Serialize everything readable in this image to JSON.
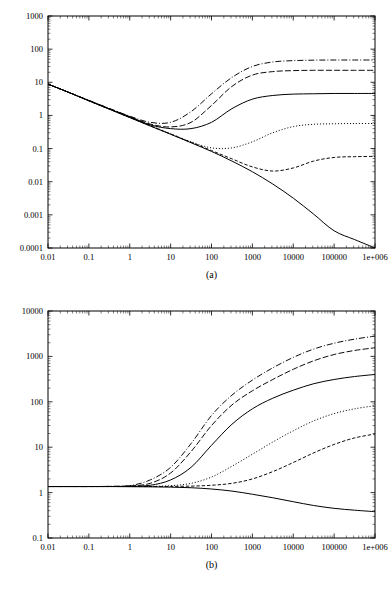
{
  "figure": {
    "panels": [
      {
        "id": "a",
        "caption": "(a)",
        "x_ticks": [
          "0.01",
          "0.1",
          "1",
          "10",
          "100",
          "1000",
          "10000",
          "100000",
          "1e+006"
        ],
        "y_ticks": [
          "0.0001",
          "0.001",
          "0.01",
          "0.1",
          "1",
          "10",
          "100",
          "1000"
        ]
      },
      {
        "id": "b",
        "caption": "(b)",
        "x_ticks": [
          "0.01",
          "0.1",
          "1",
          "10",
          "100",
          "1000",
          "10000",
          "100000",
          "1e+006"
        ],
        "y_ticks": [
          "0.1",
          "1",
          "10",
          "100",
          "1000",
          "10000"
        ]
      }
    ]
  },
  "chart_data": [
    {
      "type": "line",
      "title": "(a)",
      "xlabel": "",
      "ylabel": "",
      "xscale": "log",
      "yscale": "log",
      "xlim": [
        0.01,
        1000000
      ],
      "ylim": [
        0.0001,
        1000
      ],
      "grid": false,
      "legend": "none",
      "x_tick_labels": [
        "0.01",
        "0.1",
        "1",
        "10",
        "100",
        "1000",
        "10000",
        "100000",
        "1e+006"
      ],
      "y_tick_labels": [
        "0.0001",
        "0.001",
        "0.01",
        "0.1",
        "1",
        "10",
        "100",
        "1000"
      ],
      "x": [
        0.01,
        0.0316,
        0.1,
        0.316,
        1,
        3.16,
        10,
        31.6,
        100,
        316,
        1000,
        3160,
        10000,
        31600,
        100000,
        316000,
        1000000
      ],
      "series": [
        {
          "name": "curve-1-dashdot",
          "style": "dashdot",
          "values": [
            8.8,
            5.0,
            2.85,
            1.63,
            0.95,
            0.62,
            0.62,
            1.3,
            4.5,
            14,
            30,
            41,
            45,
            46.5,
            47,
            47,
            47
          ]
        },
        {
          "name": "curve-2-dashed",
          "style": "dashed",
          "values": [
            8.8,
            5.0,
            2.82,
            1.6,
            0.92,
            0.55,
            0.45,
            0.62,
            2.0,
            7.5,
            16.5,
            21,
            22.5,
            23,
            23,
            23,
            23
          ]
        },
        {
          "name": "curve-3-solid",
          "style": "solid",
          "values": [
            8.8,
            5.0,
            2.8,
            1.58,
            0.9,
            0.52,
            0.4,
            0.4,
            0.62,
            1.6,
            3.1,
            4.0,
            4.4,
            4.5,
            4.6,
            4.6,
            4.6
          ]
        },
        {
          "name": "curve-4-dotted",
          "style": "dotted",
          "values": [
            8.8,
            5.0,
            2.78,
            1.56,
            0.88,
            0.5,
            0.28,
            0.16,
            0.105,
            0.105,
            0.16,
            0.3,
            0.46,
            0.54,
            0.56,
            0.57,
            0.57
          ]
        },
        {
          "name": "curve-5-dashed-lower",
          "style": "dashed-short",
          "values": [
            8.8,
            5.0,
            2.76,
            1.55,
            0.87,
            0.49,
            0.275,
            0.155,
            0.087,
            0.049,
            0.028,
            0.021,
            0.026,
            0.042,
            0.054,
            0.057,
            0.058
          ]
        },
        {
          "name": "curve-6-solid-baseline",
          "style": "solid",
          "values": [
            8.8,
            5.0,
            2.75,
            1.54,
            0.86,
            0.48,
            0.27,
            0.15,
            0.082,
            0.042,
            0.02,
            0.0085,
            0.0032,
            0.00105,
            0.00033,
            0.00018,
            0.0001
          ]
        }
      ]
    },
    {
      "type": "line",
      "title": "(b)",
      "xlabel": "",
      "ylabel": "",
      "xscale": "log",
      "yscale": "log",
      "xlim": [
        0.01,
        1000000
      ],
      "ylim": [
        0.1,
        10000
      ],
      "grid": false,
      "legend": "none",
      "x_tick_labels": [
        "0.01",
        "0.1",
        "1",
        "10",
        "100",
        "1000",
        "10000",
        "100000",
        "1e+006"
      ],
      "y_tick_labels": [
        "0.1",
        "1",
        "10",
        "100",
        "1000",
        "10000"
      ],
      "x": [
        0.01,
        0.0316,
        0.1,
        0.316,
        1,
        3.16,
        10,
        31.6,
        100,
        316,
        1000,
        3160,
        10000,
        31600,
        100000,
        316000,
        1000000
      ],
      "series": [
        {
          "name": "curve-1-dashdot",
          "style": "dashdot",
          "values": [
            1.36,
            1.36,
            1.36,
            1.37,
            1.42,
            1.9,
            3.6,
            12,
            50,
            140,
            300,
            560,
            950,
            1450,
            1950,
            2400,
            2800
          ]
        },
        {
          "name": "curve-2-dashed",
          "style": "dashed",
          "values": [
            1.36,
            1.36,
            1.36,
            1.37,
            1.4,
            1.6,
            2.7,
            8.0,
            30,
            85,
            175,
            310,
            520,
            800,
            1100,
            1350,
            1550
          ]
        },
        {
          "name": "curve-3-solid",
          "style": "solid",
          "values": [
            1.36,
            1.36,
            1.36,
            1.36,
            1.38,
            1.45,
            1.9,
            3.6,
            11,
            32,
            70,
            120,
            180,
            250,
            310,
            360,
            400
          ]
        },
        {
          "name": "curve-4-dotted",
          "style": "dotted",
          "values": [
            1.36,
            1.36,
            1.36,
            1.36,
            1.36,
            1.37,
            1.42,
            1.6,
            2.2,
            3.8,
            7.0,
            13,
            23,
            38,
            55,
            70,
            82
          ]
        },
        {
          "name": "curve-5-dashed-lower",
          "style": "dashed-short",
          "values": [
            1.36,
            1.36,
            1.36,
            1.36,
            1.36,
            1.36,
            1.37,
            1.39,
            1.45,
            1.6,
            2.0,
            2.9,
            4.6,
            7.5,
            11.5,
            16,
            19.5
          ]
        },
        {
          "name": "curve-6-solid-baseline",
          "style": "solid",
          "values": [
            1.36,
            1.36,
            1.36,
            1.36,
            1.35,
            1.34,
            1.32,
            1.28,
            1.2,
            1.08,
            0.92,
            0.77,
            0.63,
            0.52,
            0.45,
            0.41,
            0.38
          ]
        }
      ]
    }
  ]
}
